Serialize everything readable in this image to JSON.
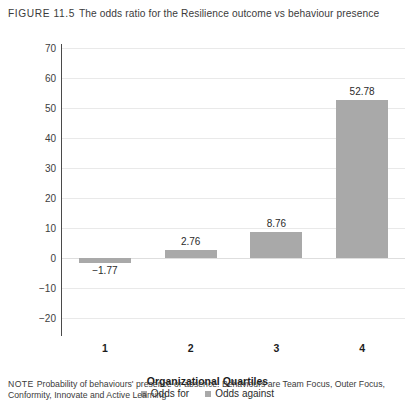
{
  "figure": {
    "label": "FIGURE 11.5",
    "title": "The odds ratio for the Resilience outcome vs behaviour presence"
  },
  "note": {
    "label": "NOTE",
    "text": "Probability of behaviours' presence or absence. Behaviours are Team Focus, Outer Focus, Conformity, Innovate and Active Learning"
  },
  "chart_data": {
    "type": "bar",
    "title": "The odds ratio for the Resilience outcome vs behaviour presence",
    "categories": [
      "1",
      "2",
      "3",
      "4"
    ],
    "values": [
      -1.77,
      2.76,
      8.76,
      52.78
    ],
    "value_labels": [
      "−1.77",
      "2.76",
      "8.76",
      "52.78"
    ],
    "xlabel": "Organizational Quartiles",
    "ylabel": "",
    "ylim": [
      -20,
      70
    ],
    "yticks": [
      70,
      60,
      50,
      40,
      30,
      20,
      10,
      0,
      -10,
      -20
    ],
    "ytick_labels": [
      "70",
      "60",
      "50",
      "40",
      "30",
      "20",
      "10",
      "0",
      "−10",
      "−20"
    ],
    "grid": true,
    "legend_position": "bottom",
    "legend": [
      {
        "name": "Odds for",
        "color": "#a9a9a9"
      },
      {
        "name": "Odds against",
        "color": "#a9a9a9"
      }
    ],
    "bar_color": "#a9a9a9"
  }
}
